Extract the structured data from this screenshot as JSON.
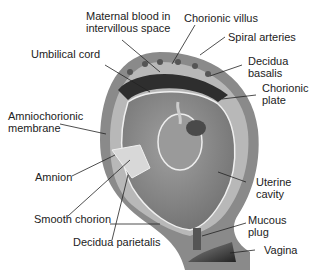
{
  "diagram": {
    "labels": {
      "maternal_blood": "Maternal blood in\nintervillous space",
      "chorionic_villus": "Chorionic villus",
      "spiral_arteries": "Spiral arteries",
      "umbilical_cord": "Umbilical cord",
      "decidua_basalis": "Decidua\nbasalis",
      "chorionic_plate": "Chorionic\nplate",
      "amniochorionic_membrane": "Amniochorionic\nmembrane",
      "amnion": "Amnion",
      "uterine_cavity": "Uterine\ncavity",
      "smooth_chorion": "Smooth chorion",
      "mucous_plug": "Mucous\nplug",
      "decidua_parietalis": "Decidua parietalis",
      "vagina": "Vagina"
    },
    "colors": {
      "uterine_wall": "#8a8a8a",
      "decidua": "#bdbdbd",
      "cavity": "#7a7a7a",
      "placenta": "#2e2e2e",
      "membrane": "#f0f0f0",
      "leader_line": "#222222"
    }
  }
}
